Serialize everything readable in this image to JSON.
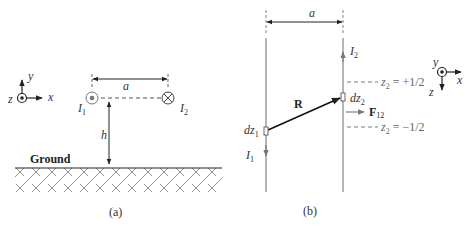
{
  "figure_a": {
    "caption": "(a)",
    "axes": {
      "x": "x",
      "y": "y",
      "z": "z"
    },
    "wire1": {
      "label": "I",
      "sub": "1",
      "direction": "out-of-page"
    },
    "wire2": {
      "label": "I",
      "sub": "2",
      "direction": "into-page"
    },
    "separation_label": "a",
    "height_label": "h",
    "ground_label": "Ground"
  },
  "figure_b": {
    "caption": "(b)",
    "axes": {
      "x": "x",
      "y": "y",
      "z": "z"
    },
    "separation_label": "a",
    "wire1": {
      "current": "I",
      "current_sub": "1",
      "element": "dz",
      "element_sub": "1"
    },
    "wire2": {
      "current": "I",
      "current_sub": "2",
      "element": "dz",
      "element_sub": "2"
    },
    "vector_R": "R",
    "force": {
      "label": "F",
      "sub": "12"
    },
    "z_upper": {
      "var": "z",
      "sub": "2",
      "value": " = +1/2"
    },
    "z_lower": {
      "var": "z",
      "sub": "2",
      "value": " = −1/2"
    }
  },
  "colors": {
    "line": "#333333",
    "gray_line": "#777777",
    "hatch": "#555555"
  }
}
